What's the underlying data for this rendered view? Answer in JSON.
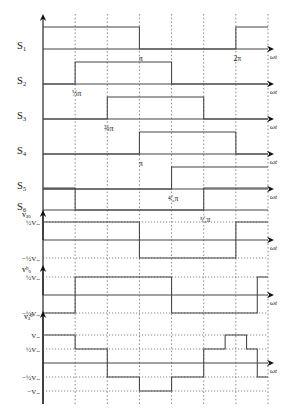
{
  "figure": {
    "x_axis_label": "ωt",
    "x_tick_labels": [
      "⅓π",
      "⅔π",
      "π",
      "⁴⁄₃π",
      "⁵⁄₃π",
      "2π"
    ],
    "x_tick_values": [
      60,
      120,
      180,
      240,
      300,
      360
    ],
    "grid": "dotted-vertical",
    "period_degrees": 420
  },
  "signals": {
    "s1": "S₁",
    "s2": "S₂",
    "s3": "S₃",
    "s4": "S₄",
    "s5": "S₅",
    "s6": "S₆",
    "vao": "vₐₒ",
    "vbo": "vᵇₒ",
    "vab": "vₐᵇ"
  },
  "level_labels": {
    "half_vdc": "½Vₑₑ",
    "neg_half_vdc": "−½Vₑₑ",
    "vdc": "Vₑₑ",
    "neg_vdc": "−Vₑₑ"
  },
  "chart_data": {
    "type": "line",
    "xlabel": "ωt",
    "ylabel": "",
    "xlim": [
      0,
      420
    ],
    "grid": true,
    "legend": "none",
    "x_ticks": [
      60,
      120,
      180,
      240,
      300,
      360
    ],
    "x_tick_labels": [
      "⅓π",
      "⅔π",
      "π",
      "⁴⁄₃π",
      "⁵⁄₃π",
      "2π"
    ],
    "series": [
      {
        "name": "S₁",
        "kind": "gate-pulse",
        "levels": [
          0,
          1
        ],
        "steps": [
          {
            "from": 0,
            "to": 180,
            "value": 1
          },
          {
            "from": 180,
            "to": 360,
            "value": 0
          },
          {
            "from": 360,
            "to": 420,
            "value": 1
          }
        ]
      },
      {
        "name": "S₂",
        "kind": "gate-pulse",
        "levels": [
          0,
          1
        ],
        "steps": [
          {
            "from": 0,
            "to": 60,
            "value": 0
          },
          {
            "from": 60,
            "to": 240,
            "value": 1
          },
          {
            "from": 240,
            "to": 420,
            "value": 0
          }
        ]
      },
      {
        "name": "S₃",
        "kind": "gate-pulse",
        "levels": [
          0,
          1
        ],
        "steps": [
          {
            "from": 0,
            "to": 120,
            "value": 0
          },
          {
            "from": 120,
            "to": 300,
            "value": 1
          },
          {
            "from": 300,
            "to": 420,
            "value": 0
          }
        ]
      },
      {
        "name": "S₄",
        "kind": "gate-pulse",
        "levels": [
          0,
          1
        ],
        "steps": [
          {
            "from": 0,
            "to": 180,
            "value": 0
          },
          {
            "from": 180,
            "to": 360,
            "value": 1
          },
          {
            "from": 360,
            "to": 420,
            "value": 0
          }
        ]
      },
      {
        "name": "S₅",
        "kind": "gate-pulse",
        "levels": [
          0,
          1
        ],
        "steps": [
          {
            "from": 0,
            "to": 240,
            "value": 0
          },
          {
            "from": 240,
            "to": 420,
            "value": 1
          }
        ]
      },
      {
        "name": "S₆",
        "kind": "gate-pulse",
        "levels": [
          0,
          1
        ],
        "steps": [
          {
            "from": 0,
            "to": 60,
            "value": 1
          },
          {
            "from": 60,
            "to": 300,
            "value": 0
          },
          {
            "from": 300,
            "to": 420,
            "value": 1
          }
        ]
      },
      {
        "name": "vₐₒ",
        "kind": "two-level",
        "levels": [
          -0.5,
          0.5
        ],
        "level_unit": "Vₑₑ",
        "steps": [
          {
            "from": 0,
            "to": 180,
            "value": 0.5
          },
          {
            "from": 180,
            "to": 360,
            "value": -0.5
          },
          {
            "from": 360,
            "to": 420,
            "value": 0.5
          }
        ]
      },
      {
        "name": "vᵇₒ",
        "kind": "two-level",
        "levels": [
          -0.5,
          0.5
        ],
        "level_unit": "Vₑₑ",
        "steps": [
          {
            "from": 0,
            "to": 60,
            "value": -0.5
          },
          {
            "from": 60,
            "to": 240,
            "value": 0.5
          },
          {
            "from": 240,
            "to": 400,
            "value": -0.5
          },
          {
            "from": 400,
            "to": 420,
            "value": 0.5
          }
        ]
      },
      {
        "name": "vₐᵇ",
        "kind": "six-step",
        "levels": [
          -1,
          -0.5,
          0,
          0.5,
          1
        ],
        "level_unit": "Vₑₑ",
        "steps": [
          {
            "from": 0,
            "to": 60,
            "value": 1
          },
          {
            "from": 60,
            "to": 120,
            "value": 0.5
          },
          {
            "from": 120,
            "to": 180,
            "value": -0.5
          },
          {
            "from": 180,
            "to": 240,
            "value": -1
          },
          {
            "from": 240,
            "to": 300,
            "value": -0.5
          },
          {
            "from": 300,
            "to": 340,
            "value": 0.5
          },
          {
            "from": 340,
            "to": 380,
            "value": 1
          },
          {
            "from": 380,
            "to": 400,
            "value": 0.5
          },
          {
            "from": 400,
            "to": 420,
            "value": -0.5
          }
        ]
      }
    ],
    "annotations": [
      {
        "text": "⅓π",
        "x": 60,
        "row": "S₂"
      },
      {
        "text": "⅔π",
        "x": 120,
        "row": "S₃"
      },
      {
        "text": "π",
        "x": 180,
        "row": "S₁"
      },
      {
        "text": "π",
        "x": 180,
        "row": "S₄"
      },
      {
        "text": "⁴⁄₃π",
        "x": 240,
        "row": "S₅"
      },
      {
        "text": "⁵⁄₃π",
        "x": 300,
        "row": "S₆"
      },
      {
        "text": "2π",
        "x": 360,
        "row": "S₁"
      }
    ]
  }
}
